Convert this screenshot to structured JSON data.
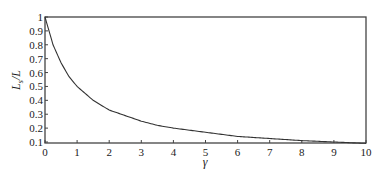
{
  "chart_data": {
    "type": "line",
    "title": "",
    "xlabel": "γ",
    "ylabel": "L_s/L",
    "ylabel_main": "L",
    "ylabel_sub": "s",
    "ylabel_den": "/L",
    "xlim": [
      0,
      10
    ],
    "ylim": [
      0.1,
      1
    ],
    "grid": false,
    "legend": null,
    "x_ticks": [
      0,
      1,
      2,
      3,
      4,
      5,
      6,
      7,
      8,
      9,
      10
    ],
    "y_ticks": [
      0.1,
      0.2,
      0.3,
      0.4,
      0.5,
      0.6,
      0.7,
      0.8,
      0.9,
      1
    ],
    "x_tick_labels": [
      "0",
      "1",
      "2",
      "3",
      "4",
      "5",
      "6",
      "7",
      "8",
      "9",
      "10"
    ],
    "y_tick_labels": [
      "0.1",
      "0.2",
      "0.3",
      "0.4",
      "0.5",
      "0.6",
      "0.7",
      "0.8",
      "0.9",
      "1"
    ],
    "series": [
      {
        "name": "L_s/L",
        "color": "#333333",
        "x": [
          0,
          0.25,
          0.5,
          0.75,
          1,
          1.5,
          2,
          2.5,
          3,
          3.5,
          4,
          5,
          6,
          7,
          8,
          9,
          10
        ],
        "values": [
          1.0,
          0.8,
          0.67,
          0.57,
          0.5,
          0.4,
          0.33,
          0.29,
          0.25,
          0.22,
          0.2,
          0.17,
          0.14,
          0.125,
          0.11,
          0.1,
          0.09
        ]
      }
    ]
  }
}
